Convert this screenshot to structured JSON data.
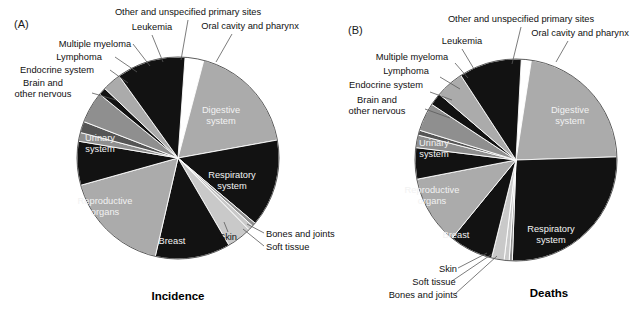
{
  "figure": {
    "background": "#ffffff",
    "width": 637,
    "height": 310
  },
  "palette": {
    "light_gray": "#ababab",
    "mid_gray": "#8f8f8f",
    "dark_gray": "#555555",
    "darker_gray": "#3d3d3d",
    "black": "#121212",
    "white": "#ffffff",
    "pale": "#c9c9c9",
    "leader": "#5a5a5a",
    "text": "#111111",
    "text_inverse": "#ffffff"
  },
  "panels": [
    {
      "tag": "(A)",
      "caption": "Incidence",
      "center": {
        "x": 178,
        "y": 158
      },
      "radius": 101,
      "start_angle": -86
    },
    {
      "tag": "(B)",
      "caption": "Deaths",
      "center": {
        "x": 516,
        "y": 160
      },
      "radius": 101,
      "start_angle": -87
    }
  ],
  "chart_data": [
    {
      "type": "pie",
      "title": "Incidence",
      "panel": "(A)",
      "labels": [
        "Oral cavity and pharynx",
        "Digestive system",
        "Respiratory system",
        "Bones and joints",
        "Soft tissue",
        "Skin",
        "Breast",
        "Reproductive organs",
        "Urinary system",
        "Brain and other nervous",
        "Endocrine system",
        "Lymphoma",
        "Multiple myeloma",
        "Leukemia",
        "Other and unspecified primary sites"
      ],
      "values": [
        3,
        18,
        14,
        0.6,
        0.8,
        4,
        12,
        17,
        7,
        1.4,
        1.8,
        5,
        1.2,
        3,
        11
      ],
      "colors": [
        "#ffffff",
        "#ababab",
        "#121212",
        "#8f8f8f",
        "#c9c9c9",
        "#c9c9c9",
        "#121212",
        "#ababab",
        "#121212",
        "#8f8f8f",
        "#555555",
        "#8f8f8f",
        "#121212",
        "#ababab",
        "#121212"
      ],
      "legend": "none",
      "xlabel": "",
      "ylabel": ""
    },
    {
      "type": "pie",
      "title": "Deaths",
      "panel": "(B)",
      "labels": [
        "Oral cavity and pharynx",
        "Digestive system",
        "Respiratory system",
        "Bones and joints",
        "Soft tissue",
        "Skin",
        "Breast",
        "Reproductive organs",
        "Urinary system",
        "Brain and other nervous",
        "Endocrine system",
        "Lymphoma",
        "Multiple myeloma",
        "Leukemia",
        "Other and unspecified primary sites"
      ],
      "values": [
        1.6,
        22,
        26,
        0.5,
        0.8,
        2,
        7,
        11,
        5,
        2,
        0.8,
        4.5,
        2,
        4.5,
        10
      ],
      "colors": [
        "#ffffff",
        "#ababab",
        "#121212",
        "#8f8f8f",
        "#c9c9c9",
        "#c9c9c9",
        "#121212",
        "#ababab",
        "#121212",
        "#8f8f8f",
        "#555555",
        "#8f8f8f",
        "#121212",
        "#ababab",
        "#121212"
      ],
      "legend": "none",
      "xlabel": "",
      "ylabel": ""
    }
  ],
  "panel_a": {
    "tag": "(A)",
    "caption": "Incidence",
    "outside_labels": [
      {
        "id": "other-primary",
        "text": "Other and unspecified primary sites",
        "x": 188,
        "y": 15,
        "anchor": "middle"
      },
      {
        "id": "oral-cavity",
        "text": "Oral cavity and pharynx",
        "x": 250,
        "y": 29,
        "anchor": "middle"
      },
      {
        "id": "leukemia",
        "text": "Leukemia",
        "x": 152,
        "y": 30,
        "anchor": "middle"
      },
      {
        "id": "multiple-myeloma",
        "text": "Multiple myeloma",
        "x": 95,
        "y": 47,
        "anchor": "middle"
      },
      {
        "id": "lymphoma",
        "text": "Lymphoma",
        "x": 79,
        "y": 60,
        "anchor": "middle"
      },
      {
        "id": "endocrine",
        "text": "Endocrine system",
        "x": 57,
        "y": 73,
        "anchor": "middle"
      },
      {
        "id": "brain-1",
        "text": "Brain and",
        "x": 43,
        "y": 86,
        "anchor": "middle"
      },
      {
        "id": "brain-2",
        "text": "other nervous",
        "x": 43,
        "y": 97,
        "anchor": "middle"
      },
      {
        "id": "bones-joints",
        "text": "Bones and joints",
        "x": 266,
        "y": 237,
        "anchor": "start"
      },
      {
        "id": "soft-tissue",
        "text": "Soft tissue",
        "x": 266,
        "y": 250,
        "anchor": "start"
      },
      {
        "id": "skin",
        "text": "Skin",
        "x": 228,
        "y": 240,
        "anchor": "middle"
      }
    ],
    "inside_labels": [
      {
        "id": "digestive",
        "lines": [
          "Digestive",
          "system"
        ],
        "x": 221,
        "y": 113
      },
      {
        "id": "respiratory",
        "lines": [
          "Respiratory",
          "system"
        ],
        "x": 232,
        "y": 178
      },
      {
        "id": "breast",
        "lines": [
          "Breast"
        ],
        "x": 172,
        "y": 244
      },
      {
        "id": "reproductive",
        "lines": [
          "Reproductive",
          "organs"
        ],
        "x": 105,
        "y": 204
      },
      {
        "id": "urinary",
        "lines": [
          "Urinary",
          "system"
        ],
        "x": 100,
        "y": 141
      }
    ]
  },
  "panel_b": {
    "tag": "(B)",
    "caption": "Deaths",
    "outside_labels": [
      {
        "id": "other-primary",
        "text": "Other and unspecified primary sites",
        "x": 521,
        "y": 22,
        "anchor": "middle"
      },
      {
        "id": "oral-cavity",
        "text": "Oral cavity and pharynx",
        "x": 580,
        "y": 36,
        "anchor": "middle"
      },
      {
        "id": "leukemia",
        "text": "Leukemia",
        "x": 462,
        "y": 44,
        "anchor": "middle"
      },
      {
        "id": "multiple-myeloma",
        "text": "Multiple myeloma",
        "x": 412,
        "y": 60,
        "anchor": "middle"
      },
      {
        "id": "lymphoma",
        "text": "Lymphoma",
        "x": 406,
        "y": 74,
        "anchor": "middle"
      },
      {
        "id": "endocrine",
        "text": "Endocrine system",
        "x": 386,
        "y": 88,
        "anchor": "middle"
      },
      {
        "id": "brain-1",
        "text": "Brain and",
        "x": 377,
        "y": 103,
        "anchor": "middle"
      },
      {
        "id": "brain-2",
        "text": "other nervous",
        "x": 377,
        "y": 114,
        "anchor": "middle"
      },
      {
        "id": "skin",
        "text": "Skin",
        "x": 448,
        "y": 272,
        "anchor": "middle"
      },
      {
        "id": "soft-tissue",
        "text": "Soft tissue",
        "x": 434,
        "y": 285,
        "anchor": "middle"
      },
      {
        "id": "bones-joints",
        "text": "Bones and joints",
        "x": 423,
        "y": 298,
        "anchor": "middle"
      }
    ],
    "inside_labels": [
      {
        "id": "digestive",
        "lines": [
          "Digestive",
          "system"
        ],
        "x": 570,
        "y": 113
      },
      {
        "id": "respiratory",
        "lines": [
          "Respiratory",
          "system"
        ],
        "x": 551,
        "y": 232
      },
      {
        "id": "breast",
        "lines": [
          "Breast"
        ],
        "x": 456,
        "y": 238
      },
      {
        "id": "reproductive",
        "lines": [
          "Reproductive",
          "organs"
        ],
        "x": 432,
        "y": 193
      },
      {
        "id": "urinary",
        "lines": [
          "Urinary",
          "system"
        ],
        "x": 434,
        "y": 146
      }
    ]
  }
}
